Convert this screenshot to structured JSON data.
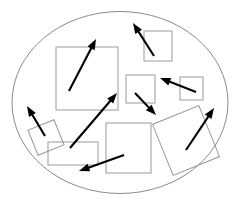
{
  "canvas": {
    "width": 244,
    "height": 206,
    "background_color": "#ffffff",
    "title": "Rectangles and arrows inside an ellipse"
  },
  "boundary": {
    "name": "ellipse",
    "cx": 120,
    "cy": 102.5,
    "rx": 108,
    "ry": 91,
    "stroke_color": "#8a8a8a",
    "stroke_width": 1,
    "fill": "none"
  },
  "style": {
    "rect_stroke_color": "#9a9a9a",
    "rect_stroke_width": 1,
    "rect_fill": "none",
    "arrow_color": "#000000",
    "arrow_stroke_width": 2.1
  },
  "rectangles": [
    {
      "id": "rect-large-upper-left",
      "x": 56,
      "y": 47,
      "width": 62,
      "height": 63,
      "rotation": 0
    },
    {
      "id": "rect-upper-right",
      "x": 144,
      "y": 31,
      "width": 28,
      "height": 30,
      "rotation": 0
    },
    {
      "id": "rect-center-small",
      "x": 126,
      "y": 75,
      "width": 29,
      "height": 28,
      "rotation": 0
    },
    {
      "id": "rect-right-small",
      "x": 180,
      "y": 77,
      "width": 23,
      "height": 23,
      "rotation": 0
    },
    {
      "id": "rect-bottom-center",
      "x": 106,
      "y": 123,
      "width": 45,
      "height": 50,
      "rotation": 0
    },
    {
      "id": "rect-wide-lower-left",
      "x": 48,
      "y": 142,
      "width": 50,
      "height": 23,
      "rotation": 0
    },
    {
      "id": "rect-rotated-lower-left",
      "x": 32,
      "y": 124,
      "width": 28,
      "height": 27,
      "rotation": -22
    },
    {
      "id": "rect-rotated-lower-right",
      "x": 161,
      "y": 113,
      "width": 50,
      "height": 55,
      "rotation": -22
    }
  ],
  "arrows": [
    {
      "id": "arrow-up-right-from-large-rect",
      "x1": 69,
      "y1": 91,
      "x2": 96,
      "y2": 39
    },
    {
      "id": "arrow-up-left-top-right",
      "x1": 154,
      "y1": 56,
      "x2": 133,
      "y2": 23
    },
    {
      "id": "arrow-up-right-diagonal-center",
      "x1": 70,
      "y1": 148,
      "x2": 117,
      "y2": 93
    },
    {
      "id": "arrow-up-left-from-center-right",
      "x1": 196,
      "y1": 92,
      "x2": 160,
      "y2": 78
    },
    {
      "id": "arrow-down-right-from-center-small",
      "x1": 135,
      "y1": 93,
      "x2": 156,
      "y2": 115
    },
    {
      "id": "arrow-up-left-lower-left",
      "x1": 45,
      "y1": 136,
      "x2": 27,
      "y2": 106
    },
    {
      "id": "arrow-down-left-bottom",
      "x1": 124,
      "y1": 155,
      "x2": 79,
      "y2": 171
    },
    {
      "id": "arrow-up-right-lower-right",
      "x1": 186,
      "y1": 150,
      "x2": 214,
      "y2": 108
    }
  ],
  "counts": {
    "rectangles": 8,
    "arrows": 8,
    "ellipses": 1
  }
}
